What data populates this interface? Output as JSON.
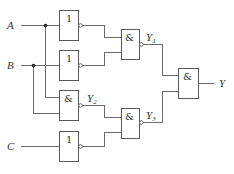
{
  "diagram": {
    "type": "logic-circuit",
    "inputs": [
      {
        "id": "A",
        "label": "A"
      },
      {
        "id": "B",
        "label": "B"
      },
      {
        "id": "C",
        "label": "C"
      }
    ],
    "gates": [
      {
        "id": "g1",
        "kind": "NOT",
        "symbol": "1",
        "inputs": [
          "A"
        ],
        "output_bubble": true
      },
      {
        "id": "g2",
        "kind": "NOT",
        "symbol": "1",
        "inputs": [
          "B"
        ],
        "output_bubble": true
      },
      {
        "id": "g3",
        "kind": "NAND",
        "symbol": "&",
        "inputs": [
          "A",
          "B"
        ],
        "output": "Y2",
        "output_bubble": true
      },
      {
        "id": "g4",
        "kind": "NOT",
        "symbol": "1",
        "inputs": [
          "C"
        ],
        "output_bubble": true
      },
      {
        "id": "g5",
        "kind": "NAND",
        "symbol": "&",
        "inputs": [
          "g1",
          "g2"
        ],
        "output": "Y1",
        "output_bubble": true
      },
      {
        "id": "g6",
        "kind": "NAND",
        "symbol": "&",
        "inputs": [
          "Y2",
          "g4"
        ],
        "output": "Y3",
        "output_bubble": true
      },
      {
        "id": "g7",
        "kind": "AND",
        "symbol": "&",
        "inputs": [
          "Y1",
          "Y3"
        ],
        "output": "Y",
        "output_bubble": false
      }
    ],
    "labels": {
      "A": "A",
      "B": "B",
      "C": "C",
      "Y": "Y",
      "Y1_main": "Y",
      "Y1_sub": "1",
      "Y2_main": "Y",
      "Y2_sub": "2",
      "Y3_main": "Y",
      "Y3_sub": "3",
      "not_symbol": "1",
      "and_symbol": "&"
    },
    "colors": {
      "wire": "#6b6b6b",
      "gate_border": "#5a5a5a",
      "text": "#333333",
      "background": "#ffffff"
    }
  }
}
